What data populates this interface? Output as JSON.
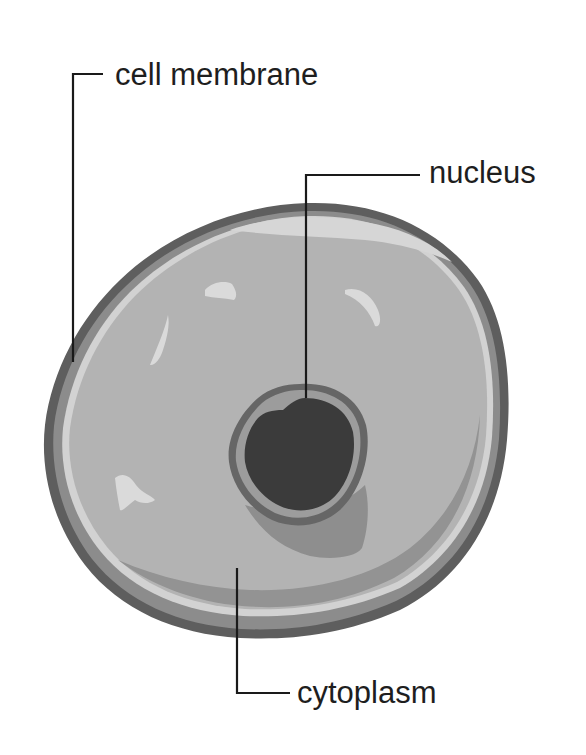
{
  "diagram": {
    "labels": [
      {
        "id": "cell-membrane",
        "text": "cell membrane"
      },
      {
        "id": "nucleus",
        "text": "nucleus"
      },
      {
        "id": "cytoplasm",
        "text": "cytoplasm"
      }
    ],
    "colors": {
      "background": "#ffffff",
      "membrane_outer": "#5e5e5e",
      "membrane_inner_band": "#8c8c8c",
      "membrane_highlight": "#d2d2d2",
      "cytoplasm": "#b3b3b3",
      "cytoplasm_shadow": "#939393",
      "highlight_spots": "#dadada",
      "nucleus_rim": "#666666",
      "nucleus_ring": "#9c9c9c",
      "nucleus_core": "#3b3b3b",
      "nucleus_shadow": "#8e8e8e",
      "label_text": "#1e1e1e",
      "leader_lines": "#1a1a1a"
    }
  }
}
